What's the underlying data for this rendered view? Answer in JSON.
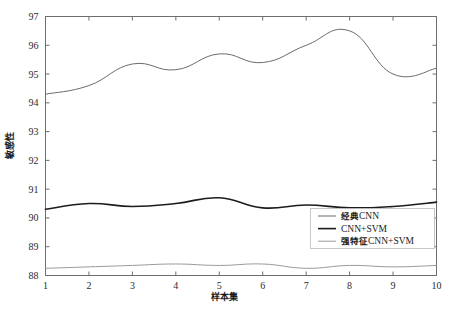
{
  "chart_data": {
    "type": "line",
    "title": "",
    "xlabel": "样本集",
    "ylabel": "敏感性",
    "x": [
      1,
      2,
      3,
      4,
      5,
      6,
      7,
      8,
      9,
      10
    ],
    "xticklabels": [
      "1",
      "2",
      "3",
      "4",
      "5",
      "6",
      "7",
      "8",
      "9",
      "10"
    ],
    "yticklabels": [
      "88",
      "89",
      "90",
      "91",
      "92",
      "93",
      "94",
      "95",
      "96",
      "97"
    ],
    "yticks": [
      88,
      89,
      90,
      91,
      92,
      93,
      94,
      95,
      96,
      97
    ],
    "xlim": [
      1,
      10
    ],
    "ylim": [
      88,
      97
    ],
    "grid": false,
    "legend_position": "lower-right",
    "series": [
      {
        "name": "经典CNN",
        "color": "#6b6b6b",
        "width": 1.0,
        "values": [
          94.3,
          94.6,
          95.35,
          95.15,
          95.7,
          95.4,
          96.0,
          96.5,
          95.0,
          95.2
        ]
      },
      {
        "name": "CNN+SVM",
        "color": "#1c1c1c",
        "width": 1.6,
        "values": [
          90.3,
          90.5,
          90.4,
          90.5,
          90.7,
          90.35,
          90.45,
          90.35,
          90.4,
          90.55
        ]
      },
      {
        "name": "强特征CNN+SVM",
        "color": "#9a9a9a",
        "width": 1.0,
        "values": [
          88.25,
          88.3,
          88.35,
          88.4,
          88.35,
          88.4,
          88.25,
          88.35,
          88.3,
          88.35
        ]
      }
    ]
  },
  "legend": {
    "entries": [
      {
        "label_cn": "经典",
        "label_en": "CNN",
        "full": "经典CNN"
      },
      {
        "label_cn": "",
        "label_en": "CNN+SVM",
        "full": "CNN+SVM"
      },
      {
        "label_cn": "强特征",
        "label_en": "CNN+SVM",
        "full": "强特征CNN+SVM"
      }
    ]
  },
  "axes": {
    "x_title": "样本集",
    "y_title": "敏感性"
  }
}
